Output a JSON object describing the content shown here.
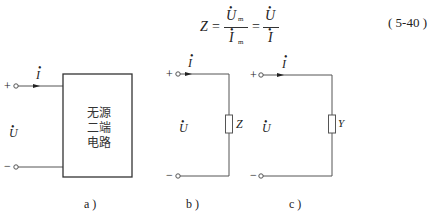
{
  "equation": {
    "lhs": "Z",
    "eq1": "=",
    "num1": "U",
    "num1_sub": "m",
    "den1": "I",
    "den1_sub": "m",
    "eq2": "=",
    "num2": "U",
    "den2": "I",
    "number": "( 5-40 )"
  },
  "figures": [
    {
      "id": "a",
      "caption": "a )",
      "plus": "+",
      "minus": "−",
      "current": "I",
      "voltage": "U",
      "box_text": [
        "无源",
        "二端",
        "电路"
      ]
    },
    {
      "id": "b",
      "caption": "b )",
      "plus": "+",
      "minus": "−",
      "current": "I",
      "voltage": "U",
      "element_label": "Z"
    },
    {
      "id": "c",
      "caption": "c )",
      "plus": "+",
      "minus": "−",
      "current": "I",
      "voltage": "U",
      "element_label": "Y"
    }
  ]
}
